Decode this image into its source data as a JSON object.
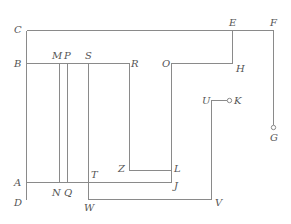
{
  "diagram": {
    "type": "wiring-path-diagram",
    "labels": [
      {
        "id": "C",
        "text": "C",
        "x": 14,
        "y": 33
      },
      {
        "id": "B",
        "text": "B",
        "x": 14,
        "y": 67
      },
      {
        "id": "M",
        "text": "M",
        "x": 52,
        "y": 59
      },
      {
        "id": "P",
        "text": "P",
        "x": 64,
        "y": 59
      },
      {
        "id": "S",
        "text": "S",
        "x": 85,
        "y": 59
      },
      {
        "id": "R",
        "text": "R",
        "x": 131,
        "y": 67
      },
      {
        "id": "E",
        "text": "E",
        "x": 229,
        "y": 26
      },
      {
        "id": "F",
        "text": "F",
        "x": 270,
        "y": 26
      },
      {
        "id": "O",
        "text": "O",
        "x": 162,
        "y": 67
      },
      {
        "id": "H",
        "text": "H",
        "x": 236,
        "y": 72
      },
      {
        "id": "U",
        "text": "U",
        "x": 202,
        "y": 104
      },
      {
        "id": "K",
        "text": "K",
        "x": 234,
        "y": 104
      },
      {
        "id": "G",
        "text": "G",
        "x": 270,
        "y": 141
      },
      {
        "id": "Z",
        "text": "Z",
        "x": 118,
        "y": 172
      },
      {
        "id": "L",
        "text": "L",
        "x": 174,
        "y": 172
      },
      {
        "id": "J",
        "text": "J",
        "x": 174,
        "y": 186
      },
      {
        "id": "A",
        "text": "A",
        "x": 14,
        "y": 186
      },
      {
        "id": "N",
        "text": "N",
        "x": 52,
        "y": 196
      },
      {
        "id": "Q",
        "text": "Q",
        "x": 64,
        "y": 196
      },
      {
        "id": "T",
        "text": "T",
        "x": 90,
        "y": 178
      },
      {
        "id": "D",
        "text": "D",
        "x": 14,
        "y": 203
      },
      {
        "id": "W",
        "text": "W",
        "x": 84,
        "y": 209
      },
      {
        "id": "V",
        "text": "V",
        "x": 214,
        "y": 204
      }
    ],
    "colors": {
      "line": "#8a8a8a",
      "text": "#555555",
      "background": "#ffffff"
    }
  }
}
